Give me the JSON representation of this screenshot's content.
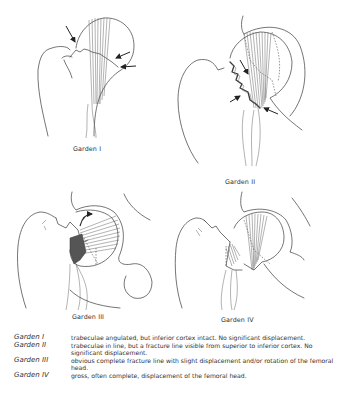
{
  "figures": [
    {
      "id": "garden-1",
      "caption": "Garden I"
    },
    {
      "id": "garden-2",
      "caption": "Garden II"
    },
    {
      "id": "garden-3",
      "caption": "Garden III"
    },
    {
      "id": "garden-4",
      "caption": "Garden IV"
    }
  ],
  "legend": [
    {
      "term": "Garden I",
      "description": "trabeculae angulated, but inferior cortex intact. No significant displacement."
    },
    {
      "term": "Garden II",
      "description": "trabeculae in line, but a fracture line visible from superior to inferior cortex. No significant displacement."
    },
    {
      "term": "Garden III",
      "description": "obvious complete fracture line with slight displacement and/or rotation of the femoral head."
    },
    {
      "term": "Garden IV",
      "description": "gross, often complete, displacement of the femoral head."
    }
  ],
  "colors": {
    "line": "#3a3a3a",
    "background": "#ffffff",
    "text": "#2f2f2f"
  }
}
